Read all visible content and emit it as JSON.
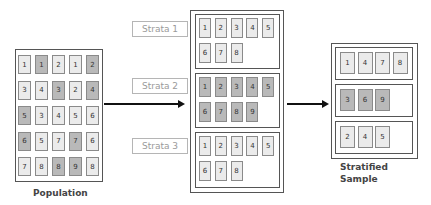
{
  "population": {
    "caption": "Population",
    "rows": [
      [
        {
          "v": "1",
          "dark": false
        },
        {
          "v": "1",
          "dark": true
        },
        {
          "v": "2",
          "dark": false
        },
        {
          "v": "1",
          "dark": false
        },
        {
          "v": "2",
          "dark": true
        }
      ],
      [
        {
          "v": "3",
          "dark": false
        },
        {
          "v": "4",
          "dark": false
        },
        {
          "v": "3",
          "dark": true
        },
        {
          "v": "2",
          "dark": false
        },
        {
          "v": "4",
          "dark": true
        }
      ],
      [
        {
          "v": "5",
          "dark": true
        },
        {
          "v": "3",
          "dark": false
        },
        {
          "v": "4",
          "dark": false
        },
        {
          "v": "5",
          "dark": false
        },
        {
          "v": "6",
          "dark": false
        }
      ],
      [
        {
          "v": "6",
          "dark": true
        },
        {
          "v": "5",
          "dark": false
        },
        {
          "v": "7",
          "dark": false
        },
        {
          "v": "7",
          "dark": true
        },
        {
          "v": "6",
          "dark": false
        }
      ],
      [
        {
          "v": "7",
          "dark": false
        },
        {
          "v": "8",
          "dark": false
        },
        {
          "v": "8",
          "dark": true
        },
        {
          "v": "9",
          "dark": true
        },
        {
          "v": "8",
          "dark": false
        }
      ]
    ]
  },
  "strata": [
    {
      "label": "Strata 1",
      "dark": false,
      "items": [
        "1",
        "2",
        "3",
        "4",
        "5",
        "6",
        "7",
        "8"
      ]
    },
    {
      "label": "Strata 2",
      "dark": true,
      "items": [
        "1",
        "2",
        "3",
        "4",
        "5",
        "6",
        "7",
        "8",
        "9"
      ]
    },
    {
      "label": "Strata 3",
      "dark": false,
      "items": [
        "1",
        "2",
        "3",
        "4",
        "5",
        "6",
        "7",
        "8"
      ]
    }
  ],
  "sample": {
    "caption_line1": "Stratified",
    "caption_line2": "Sample",
    "groups": [
      {
        "dark": false,
        "items": [
          "1",
          "4",
          "7",
          "8"
        ]
      },
      {
        "dark": true,
        "items": [
          "3",
          "6",
          "9"
        ]
      },
      {
        "dark": false,
        "items": [
          "2",
          "4",
          "5"
        ]
      }
    ]
  },
  "colors": {
    "cell_light": "#ebebeb",
    "cell_dark": "#b9b9b9",
    "border": "#555555",
    "arrow": "#111111"
  }
}
